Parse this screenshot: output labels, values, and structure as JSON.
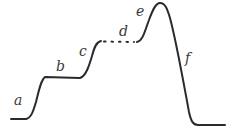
{
  "diagram": {
    "type": "segmented-curve",
    "labels": {
      "a": "a",
      "b": "b",
      "c": "c",
      "d": "d",
      "e": "e",
      "f": "f"
    },
    "segments": [
      {
        "label": "a",
        "description": "first rise"
      },
      {
        "label": "b",
        "description": "first plateau"
      },
      {
        "label": "c",
        "description": "second rise"
      },
      {
        "label": "d",
        "description": "dotted plateau"
      },
      {
        "label": "e",
        "description": "rise to peak"
      },
      {
        "label": "f",
        "description": "steep fall"
      }
    ],
    "colors": {
      "line": "#2a2a2a",
      "text": "#3a3a3a",
      "background": "#ffffff"
    }
  }
}
